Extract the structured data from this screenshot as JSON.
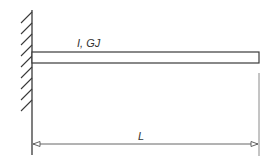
{
  "diagram": {
    "type": "cantilever-beam",
    "labels": {
      "section_properties": "I, GJ",
      "length": "L"
    },
    "colors": {
      "line": "#3a3a3a",
      "background": "#ffffff"
    },
    "elements": [
      {
        "name": "fixed-wall-support",
        "hatched": true
      },
      {
        "name": "beam",
        "label": "I, GJ"
      },
      {
        "name": "length-dimension",
        "label": "L"
      }
    ]
  }
}
